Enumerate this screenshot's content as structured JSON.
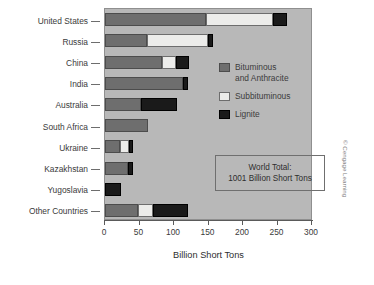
{
  "chart_data": {
    "type": "bar",
    "orientation": "horizontal",
    "stacked": true,
    "title": "",
    "xlabel": "Billion Short Tons",
    "ylabel": "",
    "xlim": [
      0,
      300
    ],
    "xticks": [
      0,
      50,
      100,
      150,
      200,
      250,
      300
    ],
    "xticklabels": [
      "0",
      "50",
      "100",
      "150",
      "200",
      "250",
      "300"
    ],
    "grid": false,
    "legend_position": "inside-right",
    "categories": [
      "United States",
      "Russia",
      "China",
      "India",
      "Australia",
      "South Africa",
      "Ukraine",
      "Kazakhstan",
      "Yugoslavia",
      "Other Countries"
    ],
    "series": [
      {
        "name": "Bituminous and Anthracite",
        "color": "#6e6e6e",
        "values": [
          146,
          61,
          82,
          113,
          52,
          63,
          22,
          34,
          0,
          48
        ]
      },
      {
        "name": "Subbituminous",
        "color": "#ececea",
        "values": [
          98,
          88,
          21,
          0,
          0,
          0,
          13,
          0,
          0,
          21
        ]
      },
      {
        "name": "Lignite",
        "color": "#1a1a1a",
        "values": [
          20,
          8,
          19,
          7,
          52,
          0,
          6,
          6,
          23,
          51
        ]
      }
    ],
    "totals": [
      264,
      157,
      122,
      120,
      104,
      63,
      41,
      40,
      23,
      120
    ],
    "annotations": [
      {
        "name": "world-total",
        "line1": "World Total:",
        "line2": "1001 Billion Short Tons"
      }
    ]
  },
  "legend": {
    "items": [
      {
        "label": "Bituminous\nand Anthracite",
        "swatch": "bituminous-swatch"
      },
      {
        "label": "Subbituminous",
        "swatch": "subbituminous-swatch"
      },
      {
        "label": "Lignite",
        "swatch": "lignite-swatch"
      }
    ]
  },
  "total_box": {
    "line1": "World Total:",
    "line2": "1001 Billion Short Tons"
  },
  "axis": {
    "x_label": "Billion Short Tons"
  },
  "credit": {
    "text": "© Cengage Learning"
  }
}
